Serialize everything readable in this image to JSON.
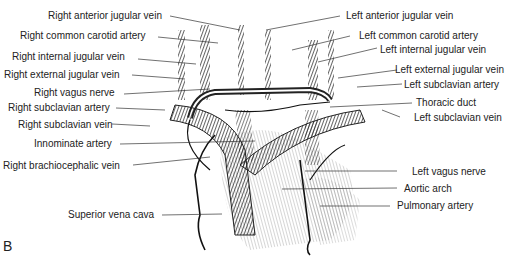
{
  "figure_label": "B",
  "labels": {
    "right_anterior_jugular_vein": "Right anterior jugular vein",
    "right_common_carotid_artery": "Right common carotid artery",
    "right_internal_jugular_vein": "Right internal jugular vein",
    "right_external_jugular_vein": "Right external jugular vein",
    "right_vagus_nerve": "Right vagus nerve",
    "right_subclavian_artery": "Right subclavian artery",
    "right_subclavian_vein": "Right subclavian vein",
    "innominate_artery": "Innominate artery",
    "right_brachiocephalic_vein": "Right brachiocephalic vein",
    "superior_vena_cava": "Superior vena cava",
    "left_anterior_jugular_vein": "Left anterior jugular vein",
    "left_common_carotid_artery": "Left common carotid artery",
    "left_internal_jugular_vein": "Left internal jugular vein",
    "left_external_jugular_vein": "Left external jugular vein",
    "left_subclavian_artery": "Left subclavian artery",
    "thoracic_duct": "Thoracic duct",
    "left_subclavian_vein": "Left  subclavian vein",
    "left_vagus_nerve": "Left vagus nerve",
    "aortic_arch": "Aortic arch",
    "pulmonary_artery": "Pulmonary artery"
  }
}
